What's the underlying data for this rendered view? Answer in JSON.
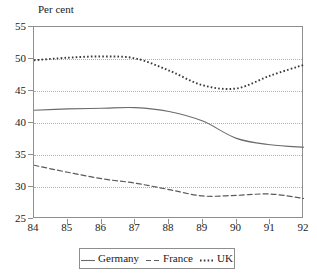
{
  "axis_title": "Per cent",
  "legend": {
    "entries": [
      {
        "label": "Germany",
        "style": "solid",
        "color": "#6b6b6b"
      },
      {
        "label": "France",
        "style": "dashed",
        "color": "#5a5a5a"
      },
      {
        "label": "UK",
        "style": "dotted",
        "color": "#3a3a3a"
      }
    ]
  },
  "chart_data": {
    "type": "line",
    "title": "",
    "subtitle": "",
    "xlabel": "",
    "ylabel": "Per cent",
    "xlim": [
      84,
      92
    ],
    "ylim": [
      25,
      55
    ],
    "grid": true,
    "grid_axis": "y",
    "legend_position": "bottom",
    "categories": [
      "84",
      "85",
      "86",
      "87",
      "88",
      "89",
      "90",
      "91",
      "92"
    ],
    "x": [
      84,
      85,
      86,
      87,
      88,
      89,
      90,
      91,
      92
    ],
    "xticks": [
      84,
      85,
      86,
      87,
      88,
      89,
      90,
      91,
      92
    ],
    "yticks": [
      25,
      30,
      35,
      40,
      45,
      50,
      55
    ],
    "series": [
      {
        "name": "Germany",
        "style": "solid",
        "color": "#6b6b6b",
        "values": [
          42.0,
          42.2,
          42.3,
          42.4,
          41.8,
          40.3,
          37.6,
          36.6,
          36.2
        ]
      },
      {
        "name": "France",
        "style": "dashed",
        "color": "#5a5a5a",
        "values": [
          33.4,
          32.3,
          31.3,
          30.6,
          29.6,
          28.6,
          28.7,
          28.9,
          28.2
        ]
      },
      {
        "name": "UK",
        "style": "dotted",
        "color": "#3a3a3a",
        "values": [
          49.8,
          50.2,
          50.4,
          50.1,
          48.2,
          45.9,
          45.4,
          47.4,
          49.1
        ]
      }
    ]
  }
}
